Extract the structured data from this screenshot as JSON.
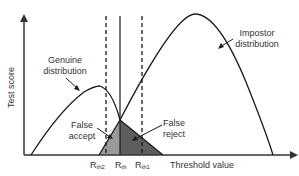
{
  "diagram": {
    "y_axis_label": "Test score",
    "x_axis_label": "Threshold value",
    "curves": {
      "genuine": "Genuine distribution",
      "impostor": "Impostor distribution"
    },
    "regions": {
      "false_accept": "False accept",
      "false_reject": "False reject"
    },
    "thresholds": [
      {
        "base": "R",
        "sub": "th2"
      },
      {
        "base": "R",
        "sub": "th"
      },
      {
        "base": "R",
        "sub": "th1"
      }
    ],
    "colors": {
      "false_accept_fill": "#9a9a9a",
      "false_reject_fill": "#5e5e5e",
      "line": "#1a1a1a"
    }
  }
}
